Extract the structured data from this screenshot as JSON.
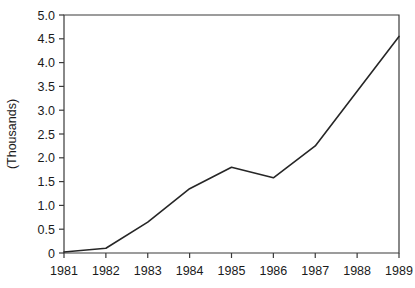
{
  "chart_data": {
    "type": "line",
    "title": "",
    "subtitle": "",
    "xlabel": "",
    "ylabel": "(Thousands)",
    "categories": [
      "1981",
      "1982",
      "1983",
      "1984",
      "1985",
      "1986",
      "1987",
      "1988",
      "1989"
    ],
    "x": [
      1981,
      1982,
      1983,
      1984,
      1985,
      1986,
      1987,
      1988,
      1989
    ],
    "values": [
      0.02,
      0.1,
      0.65,
      1.35,
      1.8,
      1.58,
      2.25,
      3.4,
      4.55
    ],
    "series": [
      {
        "name": "",
        "values": [
          0.02,
          0.1,
          0.65,
          1.35,
          1.8,
          1.58,
          2.25,
          3.4,
          4.55
        ]
      }
    ],
    "ylim": [
      0,
      5.0
    ],
    "ystep": 0.5,
    "ytick_labels": [
      "0",
      "0.5",
      "1.0",
      "1.5",
      "2.0",
      "2.5",
      "3.0",
      "3.5",
      "4.0",
      "4.5",
      "5.0"
    ],
    "ytick_values": [
      0,
      0.5,
      1.0,
      1.5,
      2.0,
      2.5,
      3.0,
      3.5,
      4.0,
      4.5,
      5.0
    ],
    "xtick_labels": [
      "1981",
      "1982",
      "1983",
      "1984",
      "1985",
      "1986",
      "1987",
      "1988",
      "1989"
    ],
    "grid": false,
    "legend": null,
    "legend_position": "none",
    "annotations": [],
    "line_color": "#262626",
    "axis_color": "#3a3a3a",
    "background_color": "#ffffff"
  },
  "plot": {
    "left": 64,
    "right": 399,
    "top": 15,
    "bottom": 253
  }
}
